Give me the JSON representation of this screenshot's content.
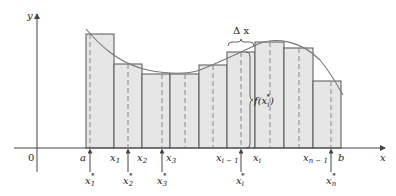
{
  "figure": {
    "type": "riemann-sum-diagram",
    "axes": {
      "x_label": "x",
      "y_label": "y",
      "origin_label": "0"
    },
    "delta_label": "Δ x",
    "function_label": "f(x",
    "function_label_sub": "i",
    "function_label_sup": "*",
    "function_label_close": ")",
    "partition_labels": [
      {
        "main": "a",
        "sub": ""
      },
      {
        "main": "x",
        "sub": "1"
      },
      {
        "main": "x",
        "sub": "2"
      },
      {
        "main": "x",
        "sub": "3"
      },
      {
        "main": "x",
        "sub": "i − 1"
      },
      {
        "main": "x",
        "sub": "i"
      },
      {
        "main": "x",
        "sub": "n − 1"
      },
      {
        "main": "b",
        "sub": ""
      }
    ],
    "sample_labels": [
      {
        "main": "x",
        "sub": "1",
        "sup": "*"
      },
      {
        "main": "x",
        "sub": "2",
        "sup": "*"
      },
      {
        "main": "x",
        "sub": "3",
        "sup": "*"
      },
      {
        "main": "x",
        "sub": "i",
        "sup": "*"
      },
      {
        "main": "x",
        "sub": "n",
        "sup": "*"
      }
    ],
    "rectangles": [
      {
        "x0": 86,
        "x1": 114,
        "top": 34,
        "sample_x": 90
      },
      {
        "x0": 114,
        "x1": 142,
        "top": 64,
        "sample_x": 128
      },
      {
        "x0": 142,
        "x1": 170,
        "top": 74,
        "sample_x": 162
      },
      {
        "x0": 170,
        "x1": 199,
        "top": 74,
        "sample_x": 185
      },
      {
        "x0": 199,
        "x1": 227,
        "top": 65,
        "sample_x": 213
      },
      {
        "x0": 227,
        "x1": 255,
        "top": 52,
        "sample_x": 241
      },
      {
        "x0": 255,
        "x1": 284,
        "top": 42,
        "sample_x": 270
      },
      {
        "x0": 284,
        "x1": 313,
        "top": 48,
        "sample_x": 299
      },
      {
        "x0": 313,
        "x1": 341,
        "top": 81,
        "sample_x": 331
      }
    ],
    "colors": {
      "rect_fill": "#e6e6e6",
      "rect_stroke": "#555555",
      "curve": "#777777",
      "axis": "#444444",
      "dash": "#888888"
    }
  }
}
